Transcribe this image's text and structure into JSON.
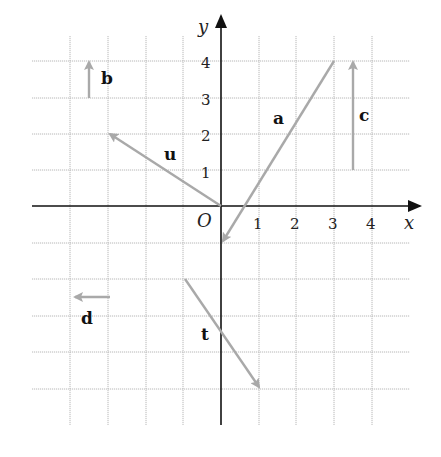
{
  "diagram": {
    "type": "vector-grid",
    "axes": {
      "x_label": "x",
      "y_label": "y",
      "origin_label": "O",
      "x_ticks": [
        "1",
        "2",
        "3",
        "4"
      ],
      "y_ticks": [
        "1",
        "2",
        "3",
        "4"
      ],
      "x_range": [
        -5,
        5
      ],
      "y_range": [
        -6,
        4
      ]
    },
    "vectors": [
      {
        "name": "a",
        "from": [
          3,
          4
        ],
        "to": [
          0,
          -1
        ]
      },
      {
        "name": "b",
        "from": [
          -3.5,
          3
        ],
        "to": [
          -3.5,
          4
        ]
      },
      {
        "name": "c",
        "from": [
          3.5,
          1
        ],
        "to": [
          3.5,
          4
        ]
      },
      {
        "name": "u",
        "from": [
          0,
          0
        ],
        "to": [
          -3,
          2
        ]
      },
      {
        "name": "d",
        "from": [
          -3,
          -2.5
        ],
        "to": [
          -4,
          -2.5
        ]
      },
      {
        "name": "t",
        "from": [
          -1,
          -2
        ],
        "to": [
          1,
          -5
        ]
      }
    ],
    "colors": {
      "vector": "#a9a9a9",
      "axis": "#111111",
      "grid": "#b8b8b8"
    }
  }
}
